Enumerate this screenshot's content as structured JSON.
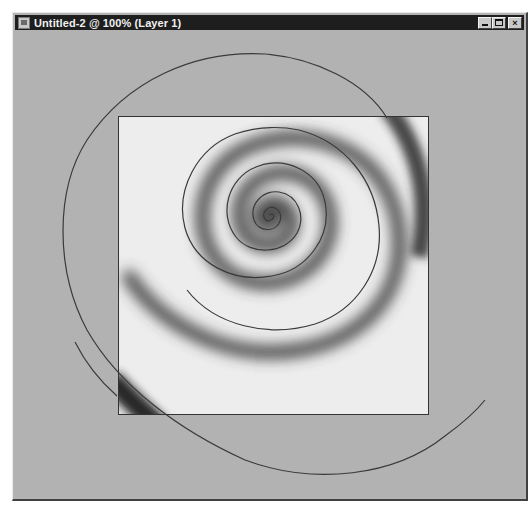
{
  "window": {
    "title": "Untitled-2 @ 100% (Layer 1)",
    "app_icon": "document-icon",
    "controls": {
      "minimize": {
        "icon": "minimize-icon",
        "label": "_"
      },
      "maximize": {
        "icon": "maximize-icon",
        "label": "□"
      },
      "close": {
        "icon": "close-icon",
        "label": "×"
      }
    }
  },
  "document": {
    "name": "Untitled-2",
    "zoom": "100%",
    "layer": "Layer 1"
  },
  "canvas": {
    "background_color": "#b2b2b2",
    "image_color": "#ececec",
    "spiral_path_color": "#3a3a3a",
    "spiral_shade_color": "#2a2a2a"
  }
}
